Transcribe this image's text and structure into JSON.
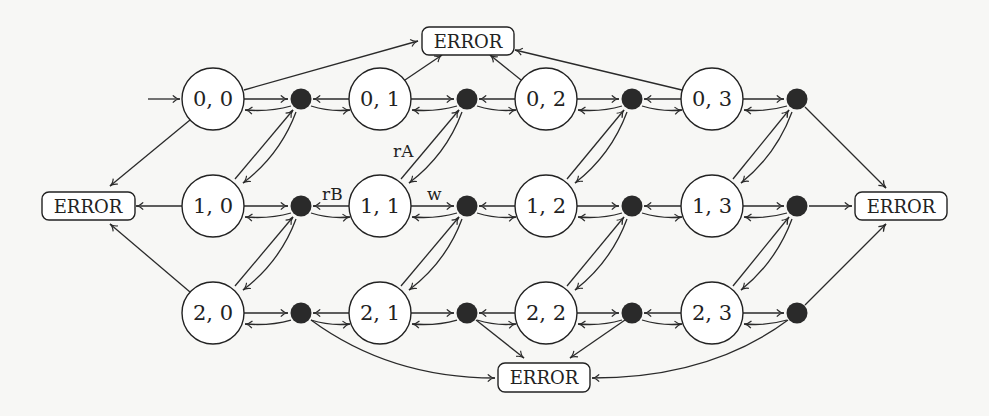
{
  "diagram": {
    "title": "",
    "states": [
      {
        "id": "s00",
        "label": "0, 0",
        "x": 213,
        "y": 99
      },
      {
        "id": "s01",
        "label": "0, 1",
        "x": 380,
        "y": 99
      },
      {
        "id": "s02",
        "label": "0, 2",
        "x": 546,
        "y": 99
      },
      {
        "id": "s03",
        "label": "0, 3",
        "x": 712,
        "y": 99
      },
      {
        "id": "s10",
        "label": "1, 0",
        "x": 213,
        "y": 206
      },
      {
        "id": "s11",
        "label": "1, 1",
        "x": 380,
        "y": 206
      },
      {
        "id": "s12",
        "label": "1, 2",
        "x": 546,
        "y": 206
      },
      {
        "id": "s13",
        "label": "1, 3",
        "x": 712,
        "y": 206
      },
      {
        "id": "s20",
        "label": "2, 0",
        "x": 213,
        "y": 313
      },
      {
        "id": "s21",
        "label": "2, 1",
        "x": 380,
        "y": 313
      },
      {
        "id": "s22",
        "label": "2, 2",
        "x": 546,
        "y": 313
      },
      {
        "id": "s23",
        "label": "2, 3",
        "x": 712,
        "y": 313
      }
    ],
    "intermediate_nodes_count": 12,
    "error_nodes": [
      {
        "id": "err_top",
        "label": "ERROR"
      },
      {
        "id": "err_left",
        "label": "ERROR"
      },
      {
        "id": "err_right",
        "label": "ERROR"
      },
      {
        "id": "err_bottom",
        "label": "ERROR"
      }
    ],
    "edge_labels": {
      "rA": "rA",
      "rB": "rB",
      "w": "w"
    },
    "initial_state": "0, 0"
  }
}
